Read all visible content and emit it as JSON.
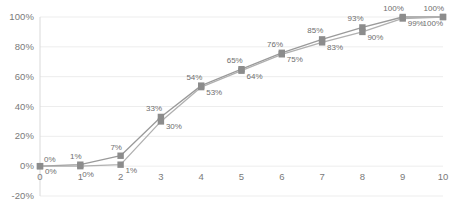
{
  "chart_data": {
    "type": "line",
    "title": "",
    "xlabel": "",
    "ylabel": "",
    "x": [
      0,
      1,
      2,
      3,
      4,
      5,
      6,
      7,
      8,
      9,
      10
    ],
    "xtick_labels": [
      "0",
      "1",
      "2",
      "3",
      "4",
      "5",
      "6",
      "7",
      "8",
      "9",
      "10"
    ],
    "ytick_labels": [
      "100%",
      "80%",
      "60%",
      "40%",
      "20%",
      "0%",
      "-20%"
    ],
    "ytick_values": [
      100,
      80,
      60,
      40,
      20,
      0,
      -20
    ],
    "ylim": [
      -20,
      100
    ],
    "xlim": [
      0,
      10
    ],
    "grid": true,
    "legend": "none",
    "marker": "square",
    "series": [
      {
        "name": "series-1",
        "values": [
          0,
          1,
          7,
          33,
          54,
          65,
          76,
          85,
          93,
          100,
          100
        ],
        "labels": [
          "0%",
          "1%",
          "7%",
          "33%",
          "54%",
          "65%",
          "76%",
          "85%",
          "93%",
          "100%",
          "100%"
        ],
        "color": "#9a9a9a",
        "label_position": "above"
      },
      {
        "name": "series-2",
        "values": [
          0,
          0,
          1,
          30,
          53,
          64,
          75,
          83,
          90,
          99,
          100
        ],
        "labels": [
          "0%",
          "0%",
          "1%",
          "30%",
          "53%",
          "64%",
          "75%",
          "83%",
          "90%",
          "99%",
          "100%"
        ],
        "color": "#b0b0b0",
        "label_position": "below"
      }
    ],
    "colors": {
      "line": "#9a9a9a",
      "marker": "#8c8c8c",
      "grid": "#ededed",
      "axis": "#d9d9d9",
      "tick_text": "#7a7a7a",
      "data_label_text": "#6e6e6e",
      "background": "#ffffff"
    }
  }
}
